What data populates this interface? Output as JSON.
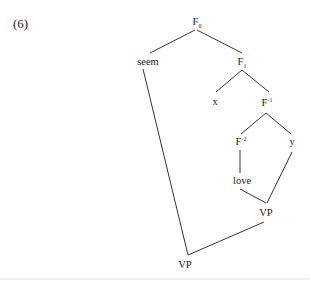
{
  "example": {
    "number": "(6)"
  },
  "tree": {
    "nodes": {
      "F0": {
        "base": "F",
        "sub": "0",
        "sup": ""
      },
      "seem": {
        "label": "seem"
      },
      "F1": {
        "base": "F",
        "sub": "1",
        "sup": ""
      },
      "x": {
        "label": "x"
      },
      "Fminus1": {
        "base": "F",
        "sub": "",
        "sup": "-1"
      },
      "Fminus2": {
        "base": "F",
        "sub": "",
        "sup": "-2"
      },
      "y": {
        "label": "y"
      },
      "love": {
        "label": "love"
      },
      "VP_upper": {
        "label": "VP"
      },
      "VP_lower": {
        "label": "VP"
      }
    },
    "edges": [
      [
        "F0",
        "seem"
      ],
      [
        "F0",
        "F1"
      ],
      [
        "F1",
        "x"
      ],
      [
        "F1",
        "Fminus1"
      ],
      [
        "Fminus1",
        "Fminus2"
      ],
      [
        "Fminus1",
        "y"
      ],
      [
        "Fminus2",
        "love"
      ],
      [
        "love",
        "VP_upper"
      ],
      [
        "y",
        "VP_upper"
      ],
      [
        "seem",
        "VP_lower"
      ],
      [
        "VP_upper",
        "VP_lower"
      ]
    ]
  }
}
